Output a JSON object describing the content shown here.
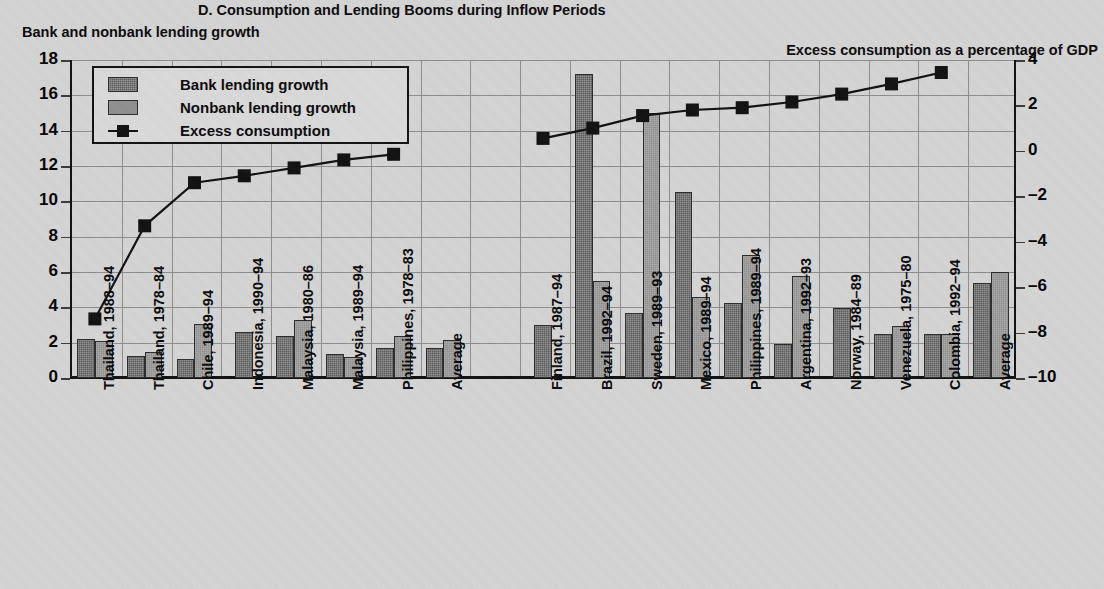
{
  "chart_title": "D. Consumption and Lending Booms during Inflow Periods",
  "left_axis_title": "Bank and nonbank lending growth",
  "right_axis_title": "Excess consumption as a percentage of GDP",
  "legend": {
    "items": [
      {
        "key": "bank",
        "label": "Bank lending growth",
        "icon": "bank-swatch"
      },
      {
        "key": "nonbank",
        "label": "Nonbank lending growth",
        "icon": "nonbank-swatch"
      },
      {
        "key": "excess",
        "label": "Excess consumption",
        "icon": "line-marker"
      }
    ]
  },
  "chart_data": {
    "type": "bar",
    "title": "D. Consumption and Lending Booms during Inflow Periods",
    "xlabel": "",
    "ylabel": "Bank and nonbank lending growth",
    "y2label": "Excess consumption as a percentage of GDP",
    "ylim": [
      0,
      18
    ],
    "y2lim": [
      -10,
      4
    ],
    "yticks": [
      0,
      2,
      4,
      6,
      8,
      10,
      12,
      14,
      16,
      18
    ],
    "y2ticks": [
      -10,
      -8,
      -6,
      -4,
      -2,
      0,
      2,
      4
    ],
    "grid": true,
    "legend_position": "top-left",
    "groups": [
      {
        "name": "panel-left",
        "categories": [
          "Thailand, 1988–94",
          "Thailand, 1978–84",
          "Chile, 1989–94",
          "Indonesia, 1990–94",
          "Malaysia, 1980–86",
          "Malaysia, 1989–94",
          "Philippines, 1978–83",
          "Average"
        ],
        "series": [
          {
            "name": "Bank lending growth",
            "values": [
              2.2,
              1.25,
              1.05,
              2.6,
              2.35,
              1.35,
              1.7,
              1.7
            ]
          },
          {
            "name": "Nonbank lending growth",
            "values": [
              2.1,
              1.45,
              3.05,
              null,
              3.3,
              1.2,
              2.35,
              2.15
            ]
          },
          {
            "name": "Excess consumption",
            "values": [
              -7.4,
              -3.3,
              -1.4,
              -1.1,
              -0.75,
              -0.4,
              -0.15,
              null
            ]
          }
        ]
      },
      {
        "name": "panel-right",
        "categories": [
          "Finland, 1987–94",
          "Brazil, 1992–94",
          "Sweden, 1989–93",
          "Mexico, 1989–94",
          "Philippines, 1989–94",
          "Argentina, 1992–93",
          "Norway, 1984–89",
          "Venezuela, 1975–80",
          "Colombia, 1992–94",
          "Average"
        ],
        "series": [
          {
            "name": "Bank lending growth",
            "values": [
              3.0,
              17.2,
              3.7,
              10.55,
              4.25,
              1.9,
              3.95,
              2.5,
              2.5,
              5.35
            ]
          },
          {
            "name": "Nonbank lending growth",
            "values": [
              null,
              5.5,
              15.0,
              4.6,
              6.95,
              5.75,
              null,
              2.95,
              2.5,
              6.0
            ]
          },
          {
            "name": "Excess consumption",
            "values": [
              0.55,
              1.0,
              1.55,
              1.8,
              1.9,
              2.15,
              2.5,
              2.95,
              3.45,
              null
            ]
          }
        ]
      }
    ]
  }
}
